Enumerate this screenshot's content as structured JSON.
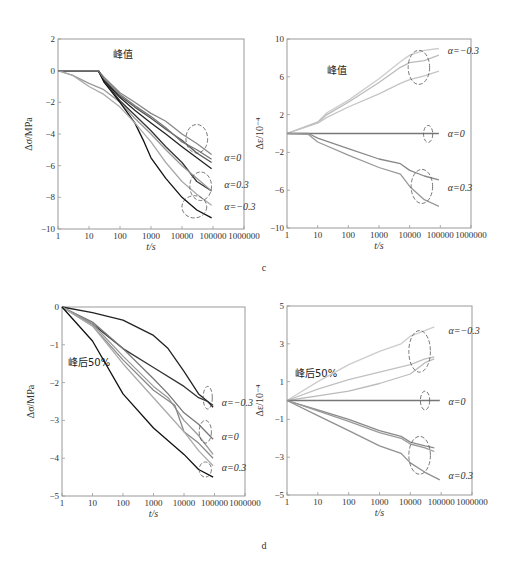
{
  "panels": [
    {
      "letter": "c"
    },
    {
      "letter": "d"
    }
  ],
  "chart_data": [
    {
      "id": "c-left",
      "type": "line",
      "title": "峰值",
      "xlabel": "t/s",
      "ylabel": "Δσ/MPa",
      "xscale": "log",
      "xlim": [
        1,
        1000000
      ],
      "ylim": [
        -10,
        2
      ],
      "xticks": [
        "1",
        "10",
        "100",
        "1000",
        "10000",
        "100000",
        "1000000"
      ],
      "yticks": [
        "2",
        "0",
        "−2",
        "−4",
        "−6",
        "−8",
        "−10"
      ],
      "ytick_values": [
        2,
        0,
        -2,
        -4,
        -6,
        -8,
        -10
      ],
      "grid": false,
      "annotations": [
        {
          "text": "α=0",
          "x": 200000,
          "y": -5.5
        },
        {
          "text": "α=0.3",
          "x": 200000,
          "y": -7.2
        },
        {
          "text": "α=−0.3",
          "x": 200000,
          "y": -8.6
        }
      ],
      "ellipses": [
        {
          "cx": 30000,
          "cy": -4.3,
          "rx": 0.35,
          "ry": 0.9
        },
        {
          "cx": 40000,
          "cy": -7.3,
          "rx": 0.35,
          "ry": 0.9
        },
        {
          "cx": 25000,
          "cy": -8.6,
          "rx": 0.4,
          "ry": 0.7
        }
      ],
      "series": [
        {
          "name": "α=0 a",
          "color": "#888888",
          "x": [
            1,
            5,
            20,
            30,
            100,
            300,
            1000,
            3000,
            10000,
            30000,
            90000
          ],
          "y": [
            0,
            0,
            0,
            -0.4,
            -1.4,
            -2.0,
            -2.7,
            -3.2,
            -4.0,
            -4.6,
            -5.3
          ]
        },
        {
          "name": "α=0 b",
          "color": "#555555",
          "x": [
            1,
            8,
            20,
            30,
            100,
            300,
            1000,
            3000,
            10000,
            30000,
            90000
          ],
          "y": [
            0,
            0,
            0,
            -0.6,
            -1.6,
            -2.3,
            -3.0,
            -3.7,
            -4.4,
            -5.2,
            -5.8
          ]
        },
        {
          "name": "α=0 c",
          "color": "#222222",
          "x": [
            1,
            8,
            20,
            30,
            100,
            300,
            1000,
            3000,
            10000,
            30000,
            90000
          ],
          "y": [
            0,
            0,
            0,
            -0.6,
            -1.7,
            -2.5,
            -3.3,
            -4.0,
            -4.8,
            -5.5,
            -6.2
          ]
        },
        {
          "name": "α=0.3 a",
          "color": "#333333",
          "x": [
            1,
            8,
            20,
            30,
            100,
            300,
            1000,
            3000,
            10000,
            30000,
            90000
          ],
          "y": [
            0,
            0,
            0,
            -0.6,
            -1.9,
            -2.8,
            -3.8,
            -4.8,
            -5.8,
            -7.0,
            -7.6
          ]
        },
        {
          "name": "α=0.3 b",
          "color": "#999999",
          "x": [
            1,
            3,
            10,
            30,
            100,
            300,
            1000,
            3000,
            10000,
            30000,
            90000
          ],
          "y": [
            0,
            -0.3,
            -0.8,
            -1.2,
            -2.0,
            -3.0,
            -4.0,
            -5.0,
            -6.0,
            -6.8,
            -7.6
          ]
        },
        {
          "name": "α=−0.3 a",
          "color": "#111111",
          "x": [
            1,
            8,
            20,
            30,
            100,
            300,
            600,
            1000,
            3000,
            10000,
            30000,
            90000
          ],
          "y": [
            0,
            0,
            0,
            -0.7,
            -2.0,
            -3.3,
            -4.5,
            -5.5,
            -6.8,
            -8.0,
            -8.8,
            -9.3
          ]
        },
        {
          "name": "α=−0.3 b",
          "color": "#aaaaaa",
          "x": [
            1,
            3,
            10,
            30,
            100,
            300,
            1000,
            3000,
            10000,
            30000,
            90000
          ],
          "y": [
            0,
            -0.3,
            -1.0,
            -1.5,
            -2.3,
            -3.3,
            -4.5,
            -5.8,
            -7.0,
            -7.8,
            -8.5
          ]
        },
        {
          "name": "α=0 d",
          "color": "#777777",
          "x": [
            1,
            8,
            20,
            30,
            100,
            300,
            1000,
            3000,
            10000,
            30000,
            90000
          ],
          "y": [
            0,
            0,
            0,
            -0.5,
            -1.5,
            -2.2,
            -2.9,
            -3.6,
            -4.5,
            -5.0,
            -5.6
          ]
        }
      ]
    },
    {
      "id": "c-right",
      "type": "line",
      "title": "峰值",
      "xlabel": "t/s",
      "ylabel": "Δε/10⁻⁴",
      "xscale": "log",
      "xlim": [
        1,
        1000000
      ],
      "ylim": [
        -10,
        10
      ],
      "xticks": [
        "1",
        "10",
        "100",
        "1000",
        "10000",
        "100000",
        "1000000"
      ],
      "yticks": [
        "10",
        "6",
        "2",
        "−2",
        "−6",
        "−10"
      ],
      "ytick_values": [
        10,
        6,
        2,
        -2,
        -6,
        -10
      ],
      "grid": false,
      "annotations": [
        {
          "text": "α=−0.3",
          "x": 150000,
          "y": 8.7
        },
        {
          "text": "α=0",
          "x": 150000,
          "y": 0
        },
        {
          "text": "α=0.3",
          "x": 150000,
          "y": -5.8
        }
      ],
      "ellipses": [
        {
          "cx": 20000,
          "cy": 7.0,
          "rx": 0.35,
          "ry": 1.8
        },
        {
          "cx": 40000,
          "cy": -0.05,
          "rx": 0.15,
          "ry": 0.9
        },
        {
          "cx": 25000,
          "cy": -5.6,
          "rx": 0.35,
          "ry": 1.8
        }
      ],
      "series": [
        {
          "name": "α=−0.3 a",
          "color": "#cccccc",
          "x": [
            1,
            10,
            20,
            100,
            1000,
            5000,
            10000,
            30000,
            90000
          ],
          "y": [
            0,
            1.2,
            2.2,
            3.5,
            5.8,
            7.6,
            8.3,
            8.8,
            9.0
          ]
        },
        {
          "name": "α=−0.3 b",
          "color": "#bbbbbb",
          "x": [
            1,
            10,
            20,
            100,
            1000,
            5000,
            10000,
            30000,
            90000
          ],
          "y": [
            0,
            1.2,
            2.0,
            3.3,
            5.4,
            7.0,
            7.5,
            7.7,
            8.3
          ]
        },
        {
          "name": "α=−0.3 c",
          "color": "#c4c4c4",
          "x": [
            1,
            10,
            20,
            100,
            1000,
            5000,
            10000,
            30000,
            90000
          ],
          "y": [
            0,
            1.1,
            1.7,
            2.8,
            4.2,
            5.3,
            5.7,
            6.1,
            6.6
          ]
        },
        {
          "name": "α=0",
          "color": "#777777",
          "x": [
            1,
            90000
          ],
          "y": [
            0,
            0
          ]
        },
        {
          "name": "α=0.3 a",
          "color": "#888888",
          "x": [
            1,
            5,
            10,
            100,
            1000,
            5000,
            10000,
            30000,
            90000
          ],
          "y": [
            0,
            0,
            -0.5,
            -1.6,
            -2.7,
            -3.2,
            -3.9,
            -4.5,
            -4.9
          ]
        },
        {
          "name": "α=0.3 b",
          "color": "#999999",
          "x": [
            1,
            5,
            10,
            100,
            1000,
            5000,
            10000,
            30000,
            90000
          ],
          "y": [
            0,
            -0.1,
            -0.9,
            -2.3,
            -3.6,
            -4.3,
            -5.6,
            -7.0,
            -7.7
          ]
        }
      ]
    },
    {
      "id": "d-left",
      "type": "line",
      "title": "峰后50%",
      "xlabel": "t/s",
      "ylabel": "Δσ/MPa",
      "xscale": "log",
      "xlim": [
        1,
        1000000
      ],
      "ylim": [
        -5,
        0
      ],
      "xticks": [
        "1",
        "10",
        "100",
        "1000",
        "10000",
        "100000",
        "1000000"
      ],
      "yticks": [
        "0",
        "−1",
        "−2",
        "−3",
        "−4",
        "−5"
      ],
      "ytick_values": [
        0,
        -1,
        -2,
        -3,
        -4,
        -5
      ],
      "grid": false,
      "annotations": [
        {
          "text": "α=−0.3",
          "x": 150000,
          "y": -2.55
        },
        {
          "text": "α=0",
          "x": 150000,
          "y": -3.45
        },
        {
          "text": "α=0.3",
          "x": 150000,
          "y": -4.25
        }
      ],
      "ellipses": [
        {
          "cx": 60000,
          "cy": -2.4,
          "rx": 0.15,
          "ry": 0.3
        },
        {
          "cx": 50000,
          "cy": -3.3,
          "rx": 0.2,
          "ry": 0.3
        },
        {
          "cx": 50000,
          "cy": -4.3,
          "rx": 0.2,
          "ry": 0.2
        }
      ],
      "series": [
        {
          "name": "α=−0.3 a",
          "color": "#222222",
          "x": [
            1,
            10,
            100,
            1000,
            3000,
            10000,
            30000,
            60000,
            90000
          ],
          "y": [
            0,
            -0.15,
            -0.35,
            -0.75,
            -1.1,
            -1.7,
            -2.3,
            -2.5,
            -2.65
          ]
        },
        {
          "name": "α=−0.3 b",
          "color": "#333333",
          "x": [
            1,
            10,
            100,
            1000,
            10000,
            30000,
            60000,
            90000
          ],
          "y": [
            0,
            -0.45,
            -1.1,
            -1.6,
            -2.1,
            -2.4,
            -2.5,
            -2.6
          ]
        },
        {
          "name": "α=0 a",
          "color": "#777777",
          "x": [
            1,
            10,
            100,
            1000,
            3000,
            10000,
            30000,
            90000
          ],
          "y": [
            0,
            -0.4,
            -1.1,
            -1.9,
            -2.3,
            -2.8,
            -3.1,
            -3.5
          ]
        },
        {
          "name": "α=0 b",
          "color": "#999999",
          "x": [
            1,
            10,
            100,
            1000,
            3000,
            10000,
            30000,
            90000
          ],
          "y": [
            0,
            -0.45,
            -1.3,
            -2.1,
            -2.4,
            -3.0,
            -3.4,
            -3.9
          ]
        },
        {
          "name": "α=0 c",
          "color": "#888888",
          "x": [
            1,
            10,
            100,
            1000,
            5000,
            10000,
            30000,
            90000
          ],
          "y": [
            0,
            -0.5,
            -1.4,
            -2.2,
            -2.6,
            -3.3,
            -3.6,
            -4.0
          ]
        },
        {
          "name": "α=0.3 a",
          "color": "#aaaaaa",
          "x": [
            1,
            10,
            100,
            1000,
            10000,
            30000,
            90000
          ],
          "y": [
            0,
            -0.5,
            -1.5,
            -2.4,
            -3.3,
            -3.8,
            -4.2
          ]
        },
        {
          "name": "α=0.3 b",
          "color": "#111111",
          "x": [
            1,
            10,
            100,
            1000,
            10000,
            30000,
            90000
          ],
          "y": [
            0,
            -0.9,
            -2.3,
            -3.2,
            -3.9,
            -4.3,
            -4.5
          ]
        }
      ]
    },
    {
      "id": "d-right",
      "type": "line",
      "title": "峰后50%",
      "xlabel": "t/s",
      "ylabel": "Δε/10⁻⁴",
      "xscale": "log",
      "xlim": [
        1,
        1000000
      ],
      "ylim": [
        -5,
        5
      ],
      "xticks": [
        "1",
        "10",
        "100",
        "1000",
        "10000",
        "100000",
        "1000000"
      ],
      "yticks": [
        "5",
        "3",
        "1",
        "−1",
        "−3",
        "−5"
      ],
      "ytick_values": [
        5,
        3,
        1,
        -1,
        -3,
        -5
      ],
      "grid": false,
      "annotations": [
        {
          "text": "α=−0.3",
          "x": 150000,
          "y": 3.7
        },
        {
          "text": "α=0",
          "x": 150000,
          "y": -0.1
        },
        {
          "text": "α=0.3",
          "x": 150000,
          "y": -4.0
        }
      ],
      "ellipses": [
        {
          "cx": 20000,
          "cy": 2.6,
          "rx": 0.35,
          "ry": 1.1
        },
        {
          "cx": 30000,
          "cy": 0.0,
          "rx": 0.15,
          "ry": 0.5
        },
        {
          "cx": 20000,
          "cy": -2.9,
          "rx": 0.35,
          "ry": 1.0
        }
      ],
      "series": [
        {
          "name": "α=−0.3 a",
          "color": "#cccccc",
          "x": [
            1,
            10,
            100,
            1000,
            5000,
            10000,
            30000,
            60000
          ],
          "y": [
            0,
            1.0,
            1.9,
            2.6,
            3.0,
            3.4,
            3.7,
            3.9
          ]
        },
        {
          "name": "α=−0.3 b",
          "color": "#c0c0c0",
          "x": [
            1,
            10,
            100,
            1000,
            10000,
            30000,
            60000
          ],
          "y": [
            0,
            0.6,
            1.1,
            1.5,
            1.9,
            2.2,
            2.3
          ]
        },
        {
          "name": "α=−0.3 c",
          "color": "#bbbbbb",
          "x": [
            1,
            10,
            100,
            1000,
            10000,
            30000,
            60000
          ],
          "y": [
            0,
            0.25,
            0.5,
            0.9,
            1.4,
            2.0,
            2.2
          ]
        },
        {
          "name": "α=0",
          "color": "#777777",
          "x": [
            1,
            90000
          ],
          "y": [
            0,
            0
          ]
        },
        {
          "name": "α=0.3 a",
          "color": "#8a8a8a",
          "x": [
            1,
            10,
            100,
            1000,
            5000,
            10000,
            30000,
            60000
          ],
          "y": [
            0,
            -0.5,
            -1.0,
            -1.6,
            -1.9,
            -2.2,
            -2.4,
            -2.5
          ]
        },
        {
          "name": "α=0.3 b",
          "color": "#999999",
          "x": [
            1,
            10,
            100,
            1000,
            5000,
            10000,
            30000,
            60000
          ],
          "y": [
            0,
            -0.55,
            -1.1,
            -1.7,
            -2.0,
            -2.3,
            -2.5,
            -2.7
          ]
        },
        {
          "name": "α=0.3 c",
          "color": "#909090",
          "x": [
            1,
            10,
            100,
            1000,
            5000,
            10000,
            30000,
            90000
          ],
          "y": [
            0,
            -0.8,
            -1.6,
            -2.4,
            -2.8,
            -3.3,
            -3.8,
            -4.2
          ]
        }
      ]
    }
  ]
}
